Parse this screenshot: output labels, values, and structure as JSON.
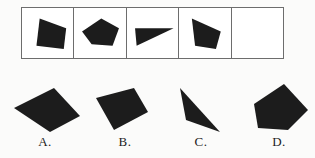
{
  "puzzle": {
    "type": "figure-sequence-multiple-choice",
    "ink_color": "#1c1c1c",
    "border_color": "#6d6d6d",
    "background_color": "#ffffff",
    "sequence": {
      "cell_count": 5,
      "cells": [
        {
          "index": 1,
          "name": "sequence-cell-1",
          "shape": "filled-quadrilateral",
          "filled": true,
          "points": "22,10 55,22 52,48 18,44"
        },
        {
          "index": 2,
          "name": "sequence-cell-2",
          "shape": "filled-pentagon",
          "filled": true,
          "points": "10,26 34,10 56,22 48,44 22,42"
        },
        {
          "index": 3,
          "name": "sequence-cell-3",
          "shape": "filled-triangle",
          "filled": true,
          "points": "10,22 58,22 12,44"
        },
        {
          "index": 4,
          "name": "sequence-cell-4",
          "shape": "filled-quadrilateral",
          "filled": true,
          "points": "16,10 52,26 46,48 20,44"
        },
        {
          "index": 5,
          "name": "sequence-cell-5",
          "shape": "empty",
          "filled": false,
          "points": ""
        }
      ]
    },
    "options": [
      {
        "key": "A",
        "label": "A.",
        "name": "option-a",
        "shape": "filled-quadrilateral",
        "points": "8,30 48,10 74,38 44,54"
      },
      {
        "key": "B",
        "label": "B.",
        "name": "option-b",
        "shape": "filled-quadrilateral",
        "points": "10,20 48,10 62,34 28,52"
      },
      {
        "key": "C",
        "label": "C.",
        "name": "option-c",
        "shape": "filled-thin-triangle",
        "points": "18,10 24,42 58,54"
      },
      {
        "key": "D",
        "label": "D.",
        "name": "option-d",
        "shape": "filled-pentagon",
        "points": "14,26 44,6 68,32 48,52 18,50"
      }
    ]
  }
}
